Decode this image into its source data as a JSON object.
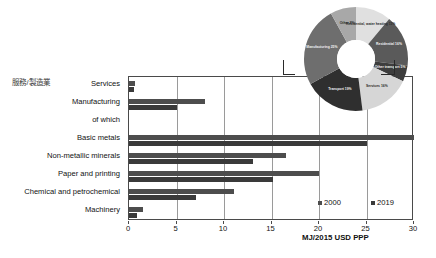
{
  "side_label": "服務/製造業",
  "chart_data": {
    "type": "bar",
    "orientation": "horizontal",
    "title": "",
    "xlabel": "MJ/2015 USD PPP",
    "ylabel": "",
    "xlim": [
      0,
      30
    ],
    "xticks": [
      0,
      5,
      10,
      15,
      20,
      25,
      30
    ],
    "grid": true,
    "legend_position": "bottom-right",
    "categories": [
      "Services",
      "Manufacturing",
      "of which",
      "Basic metals",
      "Non-metallic minerals",
      "Paper and printing",
      "Chemical and petrochemical",
      "Machinery"
    ],
    "series": [
      {
        "name": "2000",
        "color": "#4d4d4d",
        "values": [
          0.6,
          8.0,
          null,
          30.0,
          16.5,
          20.0,
          11.0,
          1.5
        ]
      },
      {
        "name": "2019",
        "color": "#3a3a3a",
        "values": [
          0.5,
          5.0,
          null,
          25.0,
          13.0,
          15.2,
          7.0,
          0.8
        ]
      }
    ],
    "inset": {
      "type": "pie",
      "style": "donut",
      "labels": [
        "Residential, water heating 11%",
        "Residential 16%",
        "Other transport 5%",
        "Services 16%",
        "Transport 19%",
        "Manufacturing 25%",
        "Other 8%"
      ],
      "values": [
        11,
        16,
        5,
        16,
        19,
        25,
        8
      ],
      "colors": [
        "#e0e0e0",
        "#5a5a5a",
        "#3d3d3d",
        "#d6d6d6",
        "#2f2f2f",
        "#6e6e6e",
        "#a8a8a8"
      ]
    }
  },
  "legend": {
    "items": [
      {
        "label": "2000",
        "color": "#4d4d4d"
      },
      {
        "label": "2019",
        "color": "#3a3a3a"
      }
    ]
  }
}
